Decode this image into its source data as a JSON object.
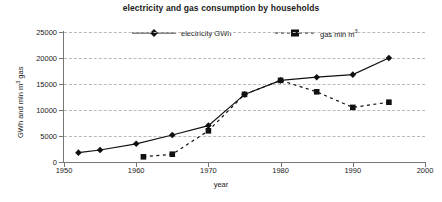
{
  "chart_data": {
    "type": "line",
    "title": "electricity and gas consumption by households",
    "xlabel": "year",
    "ylabel": "GWh and mln m3 gas",
    "ylabel_parts": {
      "pre": "GWh and mln m",
      "sup": "3",
      "post": " gas"
    },
    "xlim": [
      1950,
      2000
    ],
    "ylim": [
      0,
      25000
    ],
    "xticks": [
      1950,
      1960,
      1970,
      1980,
      1990,
      2000
    ],
    "yticks": [
      0,
      5000,
      10000,
      15000,
      20000,
      25000
    ],
    "grid": true,
    "grid_axis": "y",
    "legend_position": "top-center",
    "series": [
      {
        "name": "electricity GWh",
        "name_parts": {
          "pre": "electricity GWh",
          "sup": "",
          "post": ""
        },
        "marker": "diamond",
        "linestyle": "solid",
        "color": "#111111",
        "points": [
          {
            "x": 1952,
            "y": 1800
          },
          {
            "x": 1955,
            "y": 2300
          },
          {
            "x": 1960,
            "y": 3500
          },
          {
            "x": 1965,
            "y": 5200
          },
          {
            "x": 1970,
            "y": 7000
          },
          {
            "x": 1975,
            "y": 13000
          },
          {
            "x": 1980,
            "y": 15700
          },
          {
            "x": 1985,
            "y": 16300
          },
          {
            "x": 1990,
            "y": 16800
          },
          {
            "x": 1995,
            "y": 20000
          }
        ]
      },
      {
        "name": "gas mln m3",
        "name_parts": {
          "pre": "gas mln m",
          "sup": "3",
          "post": ""
        },
        "marker": "square",
        "linestyle": "dashed",
        "color": "#111111",
        "points": [
          {
            "x": 1961,
            "y": 1000
          },
          {
            "x": 1965,
            "y": 1500
          },
          {
            "x": 1970,
            "y": 6000
          },
          {
            "x": 1975,
            "y": 13000
          },
          {
            "x": 1980,
            "y": 15700
          },
          {
            "x": 1985,
            "y": 13500
          },
          {
            "x": 1990,
            "y": 10500
          },
          {
            "x": 1995,
            "y": 11500
          }
        ]
      }
    ]
  },
  "legend": {
    "items": [
      {
        "label": "electricity GWh"
      },
      {
        "label": "gas mln m3"
      }
    ]
  }
}
